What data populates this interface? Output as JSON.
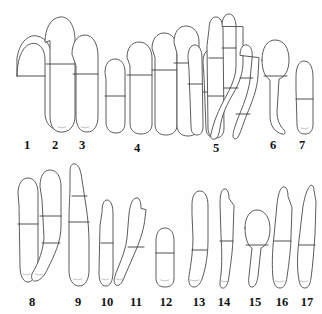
{
  "figure": {
    "kind": "scientific-line-drawing-plate",
    "background_color": "#fefefe",
    "outline_color": "#4a4a4a",
    "septum_color": "#3c3c3c",
    "guttule_color": "#9a9a9a",
    "label_color": "#111111",
    "width": 322,
    "height": 314,
    "rows": [
      {
        "row_index": 1,
        "labels": [
          {
            "text": "1",
            "x": 27,
            "y": 139
          },
          {
            "text": "2",
            "x": 55,
            "y": 139
          },
          {
            "text": "3",
            "x": 82,
            "y": 139
          },
          {
            "text": "4",
            "x": 137,
            "y": 142
          },
          {
            "text": "5",
            "x": 216,
            "y": 142
          },
          {
            "text": "6",
            "x": 273,
            "y": 139
          },
          {
            "text": "7",
            "x": 302,
            "y": 139
          }
        ]
      },
      {
        "row_index": 2,
        "labels": [
          {
            "text": "8",
            "x": 32,
            "y": 296
          },
          {
            "text": "9",
            "x": 78,
            "y": 296
          },
          {
            "text": "10",
            "x": 107,
            "y": 296
          },
          {
            "text": "11",
            "x": 136,
            "y": 296
          },
          {
            "text": "12",
            "x": 166,
            "y": 296
          },
          {
            "text": "13",
            "x": 199,
            "y": 296
          },
          {
            "text": "14",
            "x": 224,
            "y": 296
          },
          {
            "text": "15",
            "x": 255,
            "y": 296
          },
          {
            "text": "16",
            "x": 282,
            "y": 296
          },
          {
            "text": "17",
            "x": 307,
            "y": 296
          }
        ]
      }
    ],
    "specimens": [
      {
        "id": 1,
        "group_label": "1",
        "sub_count": 1,
        "shapes": [
          {
            "name": "specimen-1-body",
            "path": "M17,76 C17,66 19,56 23,50 C26,45 32,42 37,44 C42,46 45,52 45,60 L45,113 C45,120 48,126 54,129 C57,131 60,132 62,130 C63,129 63,127 61,125 C56,121 52,116 52,110 L52,60 C52,48 47,38 37,36 C27,34 19,44 17,58 Z",
            "septa": [
              "M17,76 L45,76"
            ],
            "guttules": [
              "M54,126 q4,2 7,1"
            ]
          }
        ]
      },
      {
        "id": 2,
        "group_label": "2",
        "sub_count": 1,
        "shapes": [
          {
            "name": "specimen-2-body",
            "path": "M45,42 C45,28 51,18 60,17 C69,16 75,26 75,41 L75,115 C75,125 71,131 63,132 C55,133 50,127 50,116 L50,41 Z",
            "septa": [
              "M46,64 L75,64"
            ],
            "guttules": [
              "M58,127 q4,2 8,0"
            ]
          }
        ]
      },
      {
        "id": 3,
        "group_label": "3",
        "sub_count": 1,
        "shapes": [
          {
            "name": "specimen-3-body",
            "path": "M72,54 C72,43 77,35 85,35 C93,35 98,44 98,56 L98,116 C98,126 94,132 87,132 C80,132 76,126 76,116 L76,66 Z",
            "septa": [
              "M73,74 L98,74"
            ],
            "guttules": [
              "M81,127 q4,2 8,0"
            ]
          }
        ]
      },
      {
        "id": 4,
        "group_label": "4",
        "sub_count": 4,
        "shapes": [
          {
            "name": "specimen-4a-body",
            "path": "M105,72 C105,64 109,59 115,59 C121,59 125,64 125,72 L125,122 C125,129 122,133 116,133 C110,133 106,129 106,122 L106,80 Z",
            "septa": [
              "M105,96 L125,96"
            ],
            "guttules": []
          },
          {
            "name": "specimen-4b-body",
            "path": "M127,57 C127,48 132,42 139,42 C147,42 152,49 152,58 L152,124 C152,130 148,134 141,134 C134,134 130,130 130,123 L130,66 Z",
            "septa": [
              "M127,75 L152,75"
            ],
            "guttules": []
          },
          {
            "name": "specimen-4c-body",
            "path": "M152,48 C152,39 157,33 164,33 C172,33 177,40 177,49 L177,125 C177,131 173,135 166,135 C159,135 155,131 155,124 L155,58 Z",
            "septa": [
              "M152,70 L177,70"
            ],
            "guttules": []
          },
          {
            "name": "specimen-4d-body",
            "path": "M174,42 C174,32 179,26 186,26 C194,26 199,33 199,42 L199,126 C199,132 195,136 188,136 C181,136 177,132 177,125 L177,54 Z",
            "septa": [
              "M174,63 L199,63"
            ],
            "guttules": []
          }
        ]
      },
      {
        "id": 5,
        "group_label": "5",
        "sub_count": 5,
        "shapes": [
          {
            "name": "specimen-5a-body",
            "path": "M188,57 C188,49 191,45 195,45 C199,45 202,50 202,58 L203,126 C203,132 201,135 197,135 C193,135 191,132 191,126 L189,70 Z",
            "septa": [
              "M188,84 L202,84"
            ],
            "guttules": []
          },
          {
            "name": "specimen-5b-body",
            "path": "M203,62 C203,54 206,50 210,50 C215,50 218,55 218,63 L219,128 C219,134 217,137 213,137 C209,137 206,134 206,128 L204,76 Z",
            "septa": [
              "M203,92 L218,92"
            ],
            "guttules": []
          },
          {
            "name": "specimen-5c-body",
            "path": "M209,29 C209,21 212,17 216,17 C220,17 223,22 223,30 L224,128 C224,134 221,138 216,138 C211,138 208,134 208,128 L207,46 Z",
            "septa": [
              "M209,58 L223,58",
              "M208,96 L224,96"
            ],
            "guttules": []
          },
          {
            "name": "specimen-5d-body",
            "path": "M222,26 C222,18 225,14 229,14 C233,14 236,19 236,27 L236,66 C236,80 228,92 222,104 C217,114 213,124 211,134 C210,138 212,140 215,139 C218,138 219,134 220,128 C222,114 227,104 233,94 C240,82 243,72 243,62 L243,27 Z",
            "septa": [
              "M222,48 L236,48",
              "M224,88 L238,88"
            ],
            "guttules": []
          },
          {
            "name": "specimen-5e-body",
            "path": "M240,55 C240,48 243,44 247,45 C251,46 253,51 252,59 L250,80 C248,94 243,106 238,118 C235,126 233,132 233,136 C233,139 236,140 238,137 C241,132 243,124 247,114 C252,102 257,90 258,76 L259,58 Z",
            "septa": [
              "M240,78 L253,78",
              "M236,114 L250,114"
            ],
            "guttules": []
          }
        ]
      },
      {
        "id": 6,
        "group_label": "6",
        "sub_count": 1,
        "shapes": [
          {
            "name": "specimen-6-body",
            "path": "M262,60 C262,48 267,40 275,40 C284,40 289,48 289,60 C289,70 285,77 279,79 L277,112 C277,120 280,126 284,130 C286,132 285,135 282,134 C275,132 270,126 270,116 L270,80 C265,77 262,70 262,60 Z",
            "septa": [
              "M264,76 L287,76"
            ],
            "guttules": []
          }
        ]
      },
      {
        "id": 7,
        "group_label": "7",
        "sub_count": 1,
        "shapes": [
          {
            "name": "specimen-7-body",
            "path": "M296,76 C296,67 299,61 304,61 C310,61 313,68 313,77 L313,124 C313,131 310,134 305,134 C300,134 297,131 297,124 L296,90 Z",
            "septa": [
              "M296,99 L313,99"
            ],
            "guttules": [
              "M301,128 q4,2 7,0"
            ]
          }
        ]
      },
      {
        "id": 8,
        "group_label": "8",
        "sub_count": 2,
        "shapes": [
          {
            "name": "specimen-8a-body",
            "path": "M18,193 C18,184 22,178 28,178 C34,178 38,184 38,193 L38,260 C38,273 34,281 29,282 C24,283 20,277 20,266 L19,206 Z",
            "septa": [
              "M18,224 L38,224"
            ],
            "guttules": [
              "M23,274 q4,2 8,0"
            ]
          },
          {
            "name": "specimen-8b-body",
            "path": "M40,186 C40,176 44,170 50,170 C57,170 61,177 61,187 L61,226 C61,242 54,256 48,268 C45,275 41,280 36,281 C32,282 30,277 33,272 C39,262 43,250 44,238 L42,200 Z",
            "septa": [
              "M40,216 L61,216",
              "M42,243 L60,243"
            ],
            "guttules": [
              "M35,274 q4,2 8,0"
            ]
          }
        ]
      },
      {
        "id": 9,
        "group_label": "9",
        "sub_count": 1,
        "shapes": [
          {
            "name": "specimen-9-body",
            "path": "M70,171 C70,166 72,163 75,164 C79,165 81,171 82,180 L86,206 C88,218 89,232 89,244 L89,270 C89,280 85,286 79,286 C73,286 69,280 69,270 L69,220 C69,206 70,196 70,186 Z",
            "septa": [
              "M72,196 L87,196",
              "M69,222 L89,222"
            ],
            "guttules": [
              "M73,279 q5,2 9,0"
            ]
          }
        ]
      },
      {
        "id": 10,
        "group_label": "10",
        "sub_count": 1,
        "shapes": [
          {
            "name": "specimen-10-body",
            "path": "M102,212 C102,204 104,200 107,200 C111,200 113,206 113,214 L113,272 C113,281 110,286 106,286 C101,286 99,281 99,272 L100,226 Z",
            "septa": [
              "M101,243 L113,243"
            ],
            "guttules": [
              "M102,279 q4,2 7,0"
            ]
          }
        ]
      },
      {
        "id": 11,
        "group_label": "11",
        "sub_count": 1,
        "shapes": [
          {
            "name": "specimen-11-body",
            "path": "M141,208 C141,201 139,197 136,198 C132,199 130,205 129,214 L127,238 C126,248 122,258 118,268 C115,275 113,281 115,284 C117,287 121,285 123,280 C127,270 132,260 136,250 C141,238 144,228 145,218 L146,210 Z",
            "septa": [
              "M128,247 L144,247"
            ],
            "guttules": [
              "M116,279 q4,2 7,0"
            ]
          }
        ]
      },
      {
        "id": 12,
        "group_label": "12",
        "sub_count": 1,
        "shapes": [
          {
            "name": "specimen-12-body",
            "path": "M156,241 C156,233 159,228 165,228 C171,228 174,233 174,241 L174,278 C174,284 171,287 165,287 C159,287 156,284 156,278 Z",
            "septa": [
              "M156,253 L174,253"
            ],
            "guttules": [
              "M160,280 q5,2 9,0"
            ]
          }
        ]
      },
      {
        "id": 13,
        "group_label": "13",
        "sub_count": 1,
        "shapes": [
          {
            "name": "specimen-13-body",
            "path": "M192,204 C192,196 195,191 200,191 C205,191 208,197 208,206 L208,240 C208,254 206,266 203,276 C201,283 198,287 194,287 C190,287 188,283 189,276 C191,264 193,250 193,238 L192,214 Z",
            "septa": [
              "M192,250 L207,250"
            ],
            "guttules": [
              "M190,280 q5,2 9,0"
            ]
          }
        ]
      },
      {
        "id": 14,
        "group_label": "14",
        "sub_count": 1,
        "shapes": [
          {
            "name": "specimen-14-body",
            "path": "M229,198 C229,192 227,188 224,189 C221,190 220,196 220,204 L221,236 C222,250 222,264 221,274 C220,282 219,287 222,288 C226,289 228,284 229,276 C231,262 233,248 233,236 L234,206 Z",
            "septa": [
              "M220,241 L233,241"
            ],
            "guttules": [
              "M221,281 q4,2 8,0"
            ]
          }
        ]
      },
      {
        "id": 15,
        "group_label": "15",
        "sub_count": 1,
        "shapes": [
          {
            "name": "specimen-15-body",
            "path": "M245,228 C245,217 250,210 257,210 C265,210 270,218 270,229 C270,239 266,246 261,248 L258,276 C257,283 255,287 252,287 C249,287 248,283 249,276 L252,248 C248,246 245,238 245,228 Z",
            "septa": [
              "M246,245 L268,245"
            ],
            "guttules": []
          }
        ]
      },
      {
        "id": 16,
        "group_label": "16",
        "sub_count": 1,
        "shapes": [
          {
            "name": "specimen-16-body",
            "path": "M288,196 C288,190 286,186 283,187 C280,188 278,195 277,204 L274,236 C272,252 272,268 273,278 C274,285 276,288 280,288 C284,288 286,284 287,277 C289,263 291,248 291,236 L292,208 Z",
            "septa": [
              "M274,241 L291,241"
            ],
            "guttules": [
              "M275,281 q5,2 9,0"
            ]
          }
        ]
      },
      {
        "id": 17,
        "group_label": "17",
        "sub_count": 1,
        "shapes": [
          {
            "name": "specimen-17-body",
            "path": "M314,190 C314,186 312,184 310,186 C307,189 305,196 303,206 L299,240 C297,256 297,270 299,280 C300,286 302,288 305,288 C308,288 310,285 311,278 C313,264 314,248 315,234 L316,202 Z",
            "septa": [
              "M299,245 L315,245"
            ],
            "guttules": [
              "M300,281 q4,2 8,0"
            ]
          }
        ]
      }
    ]
  }
}
